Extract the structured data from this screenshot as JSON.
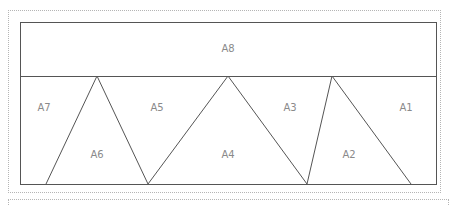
{
  "diagram": {
    "stroke_color": "#555555",
    "frame": {
      "x1": 20,
      "y1": 22,
      "x2": 437,
      "y2": 185
    },
    "divider_y": 76,
    "apexes": [
      97,
      228,
      332
    ],
    "bases": [
      46,
      148,
      307,
      411
    ],
    "regions": [
      {
        "id": "A8",
        "label": "A8",
        "x": 228,
        "y": 48
      },
      {
        "id": "A7",
        "label": "A7",
        "x": 44,
        "y": 107
      },
      {
        "id": "A5",
        "label": "A5",
        "x": 157,
        "y": 107
      },
      {
        "id": "A3",
        "label": "A3",
        "x": 290,
        "y": 107
      },
      {
        "id": "A1",
        "label": "A1",
        "x": 406,
        "y": 107
      },
      {
        "id": "A6",
        "label": "A6",
        "x": 97,
        "y": 154
      },
      {
        "id": "A4",
        "label": "A4",
        "x": 228,
        "y": 154
      },
      {
        "id": "A2",
        "label": "A2",
        "x": 349,
        "y": 154
      }
    ]
  }
}
